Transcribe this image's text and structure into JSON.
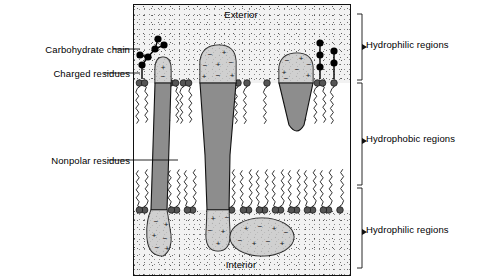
{
  "figure": {
    "type": "biological-diagram",
    "panel_bounds_px": {
      "x": 133,
      "y": 4,
      "width": 216,
      "height": 270
    }
  },
  "compartments": {
    "exterior_label": "Exterior",
    "interior_label": "Interior"
  },
  "left_labels": [
    {
      "key": "carbohydrate_chain",
      "text": "Carbohydrate chain"
    },
    {
      "key": "charged_residues",
      "text": "Charged residues"
    },
    {
      "key": "nonpolar_residues",
      "text": "Nonpolar residues"
    }
  ],
  "right_labels": [
    {
      "key": "hydrophilic_top",
      "text": "Hydrophilic regions"
    },
    {
      "key": "hydrophobic_mid",
      "text": "Hydrophobic regions"
    },
    {
      "key": "hydrophilic_bot",
      "text": "Hydrophilic regions"
    }
  ],
  "colors": {
    "outline": "#111111",
    "protein_polar_fill": "#c9c9c9",
    "protein_nonpolar_fill": "#8d8d8d",
    "head_group": "#555555",
    "carbohydrate_bead": "#000000",
    "aqueous_stipple_bg": "#f2f2f2",
    "bilayer_core_bg": "#ffffff",
    "tail_stroke": "#333333"
  },
  "charge_symbols": {
    "positive": "+",
    "negative": "−"
  },
  "structures": {
    "carbohydrate_chains": [
      {
        "name": "glycoprotein-chain-left",
        "bead_count": 7
      },
      {
        "name": "glycoprotein-chain-right",
        "bead_count": 6
      }
    ],
    "proteins": [
      {
        "name": "transmembrane-protein-1",
        "spans_bilayer": true,
        "shape": "narrow-column"
      },
      {
        "name": "transmembrane-protein-2",
        "spans_bilayer": true,
        "shape": "wide-hourglass"
      },
      {
        "name": "peripheral-protein-outer",
        "spans_bilayer": false,
        "shape": "wedge"
      },
      {
        "name": "peripheral-protein-inner",
        "spans_bilayer": false,
        "shape": "ellipse"
      }
    ],
    "phospholipid_counts": {
      "outer_leaflet_visible": 12,
      "inner_leaflet_visible": 15
    }
  }
}
